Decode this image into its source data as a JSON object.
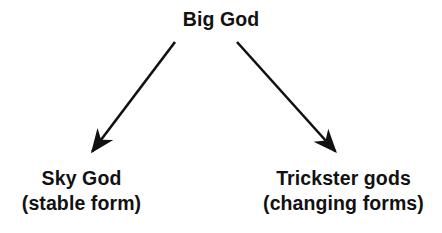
{
  "diagram": {
    "title_node": {
      "label": "Big God"
    },
    "branches": [
      {
        "id": "sky-god",
        "line1": "Sky God",
        "line2": "(stable form)"
      },
      {
        "id": "trickster-gods",
        "line1": "Trickster gods",
        "line2": "(changing forms)"
      }
    ],
    "arrows": [
      {
        "id": "arrow-to-sky-god",
        "name": "arrow-down-left-icon",
        "from_x": 175,
        "from_y": 42,
        "to_x": 88,
        "to_y": 157
      },
      {
        "id": "arrow-to-trickster-gods",
        "name": "arrow-down-right-icon",
        "from_x": 237,
        "from_y": 42,
        "to_x": 340,
        "to_y": 157
      }
    ],
    "colors": {
      "ink": "#111111",
      "background": "#ffffff"
    }
  }
}
